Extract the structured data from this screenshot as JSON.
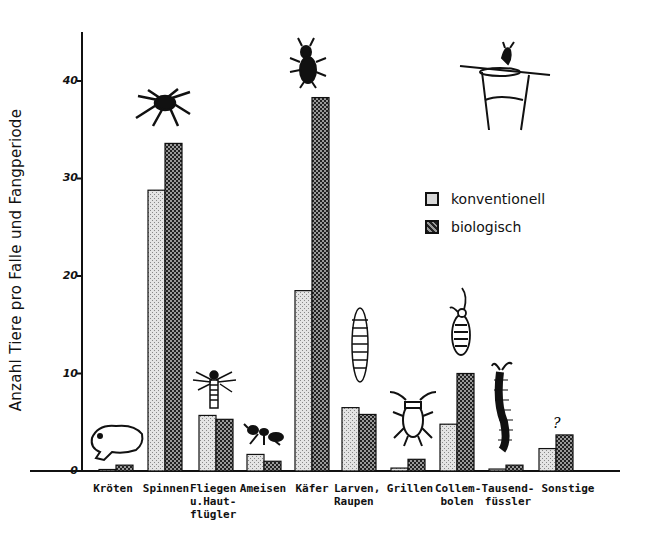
{
  "chart_data": {
    "type": "bar",
    "title": "",
    "xlabel": "",
    "ylabel": "Anzahl Tiere pro Falle und Fangperiode",
    "ylim": [
      0,
      45
    ],
    "yticks": [
      0,
      10,
      20,
      30,
      40
    ],
    "grid": false,
    "legend_position": "upper right",
    "categories": [
      "Kröten",
      "Spinnen",
      "Fliegen u.Haut-flügler",
      "Ameisen",
      "Käfer",
      "Larven, Raupen",
      "Grillen",
      "Collembolen",
      "Tausendfüssler",
      "Sonstige"
    ],
    "category_labels": [
      "Kröten",
      "Spinnen",
      "Fliegen\nu.Haut-\nflügler",
      "Ameisen",
      "Käfer",
      "Larven,\nRaupen",
      "Grillen",
      "Collem-\nbolen",
      "Tausend-\nfüssler",
      "Sonstige"
    ],
    "series": [
      {
        "name": "konventionell",
        "values": [
          0.1,
          28.8,
          5.7,
          1.7,
          18.5,
          6.5,
          0.3,
          4.8,
          0.2,
          2.3
        ]
      },
      {
        "name": "biologisch",
        "values": [
          0.6,
          33.6,
          5.3,
          1.0,
          38.3,
          5.8,
          1.2,
          10.0,
          0.6,
          3.7
        ]
      }
    ],
    "annotations": [
      "toad drawing (Kröten)",
      "spider drawing (Spinnen)",
      "fly drawing (Fliegen)",
      "ant drawing (Ameisen)",
      "beetle drawing (Käfer)",
      "larva drawing (Larven)",
      "cricket drawing (Grillen)",
      "springtail drawing (Collembolen)",
      "millipede drawing (Tausendfüssler)",
      "question mark (Sonstige)",
      "pitfall trap cup drawing (top right)"
    ]
  },
  "legend": {
    "items": [
      {
        "label": "konventionell",
        "color": "#c8c8c8"
      },
      {
        "label": "biologisch",
        "color": "#555555"
      }
    ]
  },
  "axis": {
    "ylabel": "Anzahl Tiere pro Falle und Fangperiode",
    "ticks": [
      "0",
      "10",
      "20",
      "30",
      "40"
    ]
  },
  "annotations": {
    "sonstige_mark": "?"
  }
}
